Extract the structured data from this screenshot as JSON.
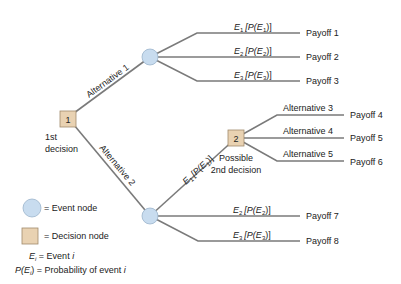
{
  "diagram": {
    "type": "decision-tree",
    "nodes": {
      "decision1": {
        "label": "1",
        "caption_line1": "1st",
        "caption_line2": "decision"
      },
      "decision2": {
        "label": "2",
        "caption_line1": "Possible",
        "caption_line2": "2nd decision"
      },
      "event_top": {},
      "event_bottom": {}
    },
    "branches": {
      "alt1": "Alternative 1",
      "alt2": "Alternative 2",
      "alt3": "Alternative 3",
      "alt4": "Alternative 4",
      "alt5": "Alternative 5"
    },
    "events": {
      "top": [
        {
          "e": "E",
          "sub": "1",
          "p_open": "[P(E",
          "p_sub": "1",
          "p_close": ")]",
          "payoff": "Payoff 1"
        },
        {
          "e": "E",
          "sub": "2",
          "p_open": "[P(E",
          "p_sub": "2",
          "p_close": ")]",
          "payoff": "Payoff 2"
        },
        {
          "e": "E",
          "sub": "3",
          "p_open": "[P(E",
          "p_sub": "3",
          "p_close": ")]",
          "payoff": "Payoff 3"
        }
      ],
      "bottom": [
        {
          "e": "E",
          "sub": "1",
          "p_open": "[P(E",
          "p_sub": "1",
          "p_close": ")]"
        },
        {
          "e": "E",
          "sub": "2",
          "p_open": "[P(E",
          "p_sub": "2",
          "p_close": ")]",
          "payoff": "Payoff 7"
        },
        {
          "e": "E",
          "sub": "3",
          "p_open": "[P(E",
          "p_sub": "3",
          "p_close": ")]",
          "payoff": "Payoff 8"
        }
      ]
    },
    "second_decision_payoffs": [
      "Payoff 4",
      "Payoff 5",
      "Payoff 6"
    ],
    "legend": {
      "event_node": "= Event node",
      "decision_node": "= Decision node",
      "ei_lhs": "E",
      "ei_sub": "i",
      "ei_rhs": " = Event ",
      "ei_var": "i",
      "pei_lhs": "P(E",
      "pei_sub": "i",
      "pei_mid": ") = Probability of event ",
      "pei_var": "i"
    },
    "colors": {
      "event_fill": "#c8dcef",
      "decision_fill": "#e9d2b2",
      "line": "#7a7a7a"
    }
  }
}
